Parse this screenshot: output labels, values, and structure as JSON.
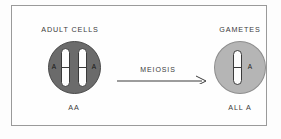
{
  "figure": {
    "frame_color": "#9a9a9a",
    "background": "#fdfdfd"
  },
  "left_panel": {
    "heading": "ADULT CELLS",
    "genotype_label": "AA",
    "cell_color": "#6b6b6b",
    "chromosome_count": 2,
    "alleles": [
      "A",
      "A"
    ]
  },
  "process": {
    "label": "MEIOSIS",
    "arrow_direction": "right",
    "arrow_color": "#3a3a3a"
  },
  "right_panel": {
    "heading": "GAMETES",
    "genotype_label": "ALL A",
    "cell_color": "#b5b5b5",
    "chromosome_count": 1,
    "alleles": [
      "A"
    ]
  }
}
